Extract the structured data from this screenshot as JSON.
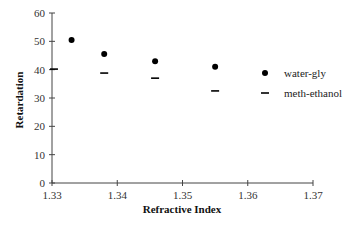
{
  "chart_data": {
    "type": "scatter",
    "title": "",
    "xlabel": "Refractive Index",
    "ylabel": "Retardation",
    "xlim": [
      1.33,
      1.37
    ],
    "ylim": [
      0,
      60
    ],
    "x_ticks": [
      "1.33",
      "1.34",
      "1.35",
      "1.36",
      "1.37"
    ],
    "y_ticks": [
      "0",
      "10",
      "20",
      "30",
      "40",
      "50",
      "60"
    ],
    "grid": false,
    "legend_position": "right",
    "series": [
      {
        "name": "water-gly",
        "marker": "circle",
        "color": "#000000",
        "x": [
          1.333,
          1.338,
          1.3458,
          1.355
        ],
        "y": [
          50.5,
          45.5,
          43.0,
          41.0
        ]
      },
      {
        "name": "meth-ethanol",
        "marker": "dash",
        "color": "#000000",
        "x": [
          1.3303,
          1.338,
          1.3458,
          1.355
        ],
        "y": [
          40.2,
          38.8,
          37.0,
          32.5
        ]
      }
    ]
  },
  "legend": {
    "items": [
      {
        "label": "water-gly",
        "marker": "circle"
      },
      {
        "label": "meth-ethanol",
        "marker": "dash"
      }
    ]
  }
}
